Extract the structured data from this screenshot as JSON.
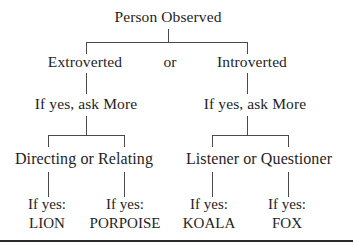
{
  "diagram": {
    "root": {
      "label": "Person Observed"
    },
    "level1": {
      "connector": "or",
      "left": {
        "label": "Extroverted"
      },
      "right": {
        "label": "Introverted"
      }
    },
    "level2": {
      "left": {
        "label": "If yes, ask More"
      },
      "right": {
        "label": "If yes, ask More"
      }
    },
    "level3": {
      "left": {
        "label": "Directing or Relating"
      },
      "right": {
        "label": "Listener or Questioner"
      }
    },
    "leaves": [
      {
        "prefix": "If yes:",
        "animal": "LION"
      },
      {
        "prefix": "If yes:",
        "animal": "PORPOISE"
      },
      {
        "prefix": "If yes:",
        "animal": "KOALA"
      },
      {
        "prefix": "If yes:",
        "animal": "FOX"
      }
    ]
  },
  "colors": {
    "text": "#1e1e1e",
    "lines": "#4a4a4a",
    "background": "#ffffff"
  }
}
